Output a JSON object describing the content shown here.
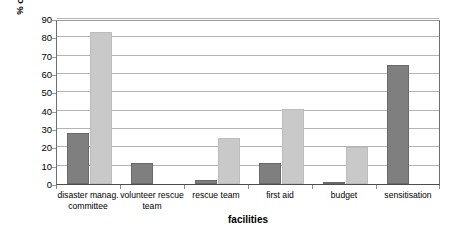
{
  "chart_data": {
    "type": "bar",
    "title": "",
    "xlabel": "facilities",
    "ylabel": "% of respondants",
    "ylim": [
      0,
      90
    ],
    "yticks": [
      0,
      10,
      20,
      30,
      40,
      50,
      60,
      70,
      80,
      90
    ],
    "grid": true,
    "legend": "none",
    "categories": [
      "disaster manag. committee",
      "volunteer rescue team",
      "rescue team",
      "first aid",
      "budget",
      "sensitisation"
    ],
    "series": [
      {
        "name": "series-1",
        "color": "#7f7f7f",
        "values": [
          28,
          11.5,
          2,
          11.5,
          1,
          65
        ]
      },
      {
        "name": "series-2",
        "color": "#c9c9c9",
        "values": [
          83,
          0,
          25,
          41,
          20,
          0
        ]
      }
    ]
  },
  "axis": {
    "y_title": "% of respondants",
    "x_title": "facilities",
    "y_tick_labels": [
      "0",
      "10",
      "20",
      "30",
      "40",
      "50",
      "60",
      "70",
      "80",
      "90"
    ]
  },
  "colors": {
    "series_dark": "#7f7f7f",
    "series_light": "#c9c9c9",
    "gridline": "#b4b4b4",
    "axis": "#4d4d4d",
    "background": "#ffffff"
  }
}
